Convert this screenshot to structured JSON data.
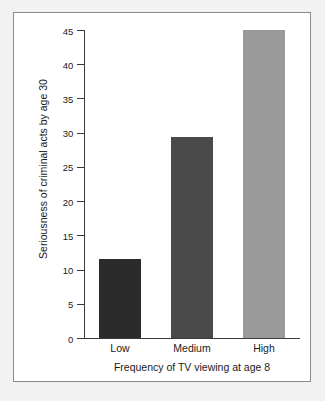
{
  "figure": {
    "background_color": "#ffffff",
    "frame_color": "#8a8a8a",
    "axis_color": "#3a3a3a"
  },
  "chart_data": {
    "type": "bar",
    "title": "",
    "subtitle": "",
    "categories": [
      "Low",
      "Medium",
      "High"
    ],
    "values": [
      11.5,
      29.3,
      45
    ],
    "xlabel": "Frequency of TV viewing at age 8",
    "ylabel": "Seriousness of criminal acts by age 30",
    "ylim": [
      0,
      45
    ],
    "ytick_labels": [
      "0",
      "5",
      "10",
      "15",
      "20",
      "25",
      "30",
      "35",
      "40",
      "45"
    ],
    "ytick_values": [
      0,
      5,
      10,
      15,
      20,
      25,
      30,
      35,
      40,
      45
    ],
    "ytick_step": 5,
    "grid": false,
    "legend": false,
    "legend_position": "none",
    "bar_colors": [
      "#2b2b2b",
      "#4a4a4a",
      "#9a9a9a"
    ],
    "orientation": "vertical"
  }
}
